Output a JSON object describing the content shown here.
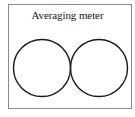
{
  "diagram": {
    "title": "Averaging meter",
    "shapes": [
      {
        "type": "circle",
        "name": "left-circle",
        "cx": 42,
        "cy": 68,
        "r": 28.5
      },
      {
        "type": "circle",
        "name": "right-circle",
        "cx": 99,
        "cy": 68,
        "r": 28.5
      }
    ],
    "colors": {
      "stroke": "#1a1a1a",
      "frame": "#8a8a8a",
      "background": "#ffffff"
    }
  }
}
